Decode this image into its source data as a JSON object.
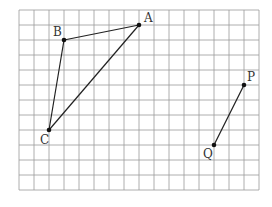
{
  "grid": {
    "x0": 19,
    "y0": 10,
    "cell": 15,
    "cols": 16,
    "rows": 12,
    "line_color": "#999999"
  },
  "points": [
    {
      "name": "A",
      "col": 8,
      "row": 1,
      "label_dx": 5,
      "label_dy": -3
    },
    {
      "name": "B",
      "col": 3,
      "row": 2,
      "label_dx": -11,
      "label_dy": -4
    },
    {
      "name": "C",
      "col": 2,
      "row": 8,
      "label_dx": -9,
      "label_dy": 14
    },
    {
      "name": "P",
      "col": 15,
      "row": 5,
      "label_dx": 3,
      "label_dy": -4
    },
    {
      "name": "Q",
      "col": 13,
      "row": 9,
      "label_dx": -11,
      "label_dy": 13
    }
  ],
  "segments": [
    [
      "A",
      "B"
    ],
    [
      "B",
      "C"
    ],
    [
      "C",
      "A"
    ],
    [
      "P",
      "Q"
    ]
  ],
  "labels": {
    "A": "A",
    "B": "B",
    "C": "C",
    "P": "P",
    "Q": "Q"
  }
}
